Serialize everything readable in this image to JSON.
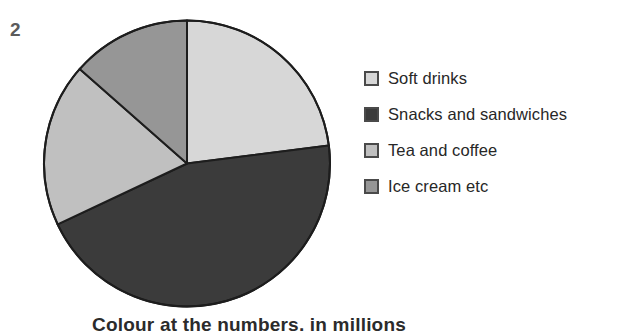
{
  "figure": {
    "item_number": "2",
    "bottom_caption": "Colour at the numbers, in millions"
  },
  "legend": {
    "items": [
      {
        "label": "Soft drinks",
        "color": "#d7d7d7",
        "swatch_name": "legend-swatch-soft-drinks"
      },
      {
        "label": "Snacks and sandwiches",
        "color": "#3b3b3b",
        "swatch_name": "legend-swatch-snacks-and-sandwiches"
      },
      {
        "label": "Tea and coffee",
        "color": "#c0c0c0",
        "swatch_name": "legend-swatch-tea-and-coffee"
      },
      {
        "label": "Ice cream etc",
        "color": "#969696",
        "swatch_name": "legend-swatch-ice-cream-etc"
      }
    ]
  },
  "chart_data": {
    "type": "pie",
    "title": "",
    "labels": [
      "Soft drinks",
      "Snacks and sandwiches",
      "Tea and coffee",
      "Ice cream etc"
    ],
    "values": [
      23,
      45,
      18.5,
      13.5
    ],
    "unit": "percent",
    "colors": [
      "#d7d7d7",
      "#3b3b3b",
      "#c0c0c0",
      "#969696"
    ],
    "start_angle_deg": 0,
    "direction": "clockwise",
    "slice_angles_deg": [
      82.8,
      162.0,
      66.6,
      48.6
    ],
    "stroke_color": "#1d1d1d",
    "stroke_width": 2,
    "legend_position": "right",
    "grid": false
  }
}
